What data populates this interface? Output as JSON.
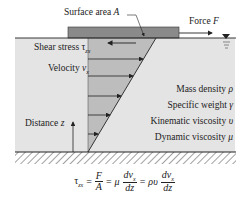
{
  "labels": {
    "surface_area": {
      "text": "Surface area ",
      "symbol": "A"
    },
    "force": {
      "text": "Force ",
      "symbol": "F"
    },
    "shear_stress": {
      "text": "Shear stress ",
      "symbol": "τ",
      "sub": "zx"
    },
    "velocity": {
      "text": "Velocity ",
      "symbol": "v",
      "sub": "x"
    },
    "distance": {
      "text": "Distance ",
      "symbol": "z"
    },
    "properties": [
      {
        "text": "Mass density ",
        "symbol": "ρ"
      },
      {
        "text": "Specific weight ",
        "symbol": "γ"
      },
      {
        "text": "Kinematic viscosity ",
        "symbol": "υ"
      },
      {
        "text": "Dynamic viscosity ",
        "symbol": "μ"
      }
    ]
  },
  "equation": {
    "lhs": "τ",
    "lhs_sub": "zx",
    "eq1": "=",
    "frac1_num": "F",
    "frac1_den": "A",
    "eq2": "=",
    "mu": "μ",
    "frac2_num": "dv",
    "frac2_num_sub": "x",
    "frac2_den": "dz",
    "eq3": "=",
    "rho_nu": "ρυ",
    "frac3_num": "dv",
    "frac3_num_sub": "x",
    "frac3_den": "dz"
  },
  "colors": {
    "fluid": "#e4e4e4",
    "plate": "#8a8a8a",
    "profile": "#bdbdbd",
    "line": "#222222"
  }
}
